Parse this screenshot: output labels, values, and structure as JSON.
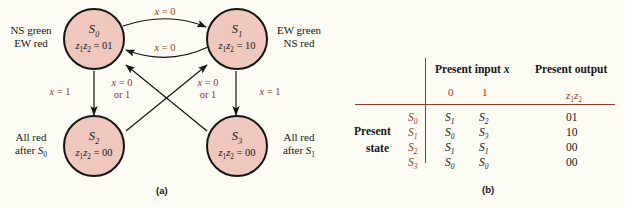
{
  "figure": {
    "panel_a_caption": "(a)",
    "panel_b_caption": "(b)",
    "colors": {
      "node_fill": "#efc7bd",
      "node_stroke": "#141414",
      "label_accent": "#8f3d28",
      "background": "#fdfcf4"
    }
  },
  "diagram": {
    "states": [
      {
        "id": "S0",
        "name": "S",
        "name_sub": "0",
        "output_prefix": "z",
        "output_label": "z₁z₂ = 01",
        "output_value": "01",
        "side_label_line1": "NS green",
        "side_label_line2": "EW red",
        "side_label_position": "left"
      },
      {
        "id": "S1",
        "name": "S",
        "name_sub": "1",
        "output_prefix": "z",
        "output_label": "z₁z₂ = 10",
        "output_value": "10",
        "side_label_line1": "EW green",
        "side_label_line2": "NS red",
        "side_label_position": "right"
      },
      {
        "id": "S2",
        "name": "S",
        "name_sub": "2",
        "output_prefix": "z",
        "output_label": "z₁z₂ = 00",
        "output_value": "00",
        "side_label_line1": "All red",
        "side_label_line2": "after S₀",
        "side_label_position": "left"
      },
      {
        "id": "S3",
        "name": "S",
        "name_sub": "3",
        "output_prefix": "z",
        "output_label": "z₁z₂ = 00",
        "output_value": "00",
        "side_label_line1": "All red",
        "side_label_line2": "after S₁",
        "side_label_position": "right"
      }
    ],
    "transitions": [
      {
        "from": "S0",
        "to": "S1",
        "label_line1": "x = 0",
        "label_line2": ""
      },
      {
        "from": "S1",
        "to": "S0",
        "label_line1": "x = 0",
        "label_line2": ""
      },
      {
        "from": "S0",
        "to": "S2",
        "label_line1": "x = 1",
        "label_line2": ""
      },
      {
        "from": "S1",
        "to": "S3",
        "label_line1": "x = 1",
        "label_line2": ""
      },
      {
        "from": "S2",
        "to": "S1",
        "label_line1": "x = 0",
        "label_line2": "or 1"
      },
      {
        "from": "S3",
        "to": "S0",
        "label_line1": "x = 0",
        "label_line2": "or 1"
      }
    ]
  },
  "table": {
    "header_input": "Present input x",
    "header_output": "Present output",
    "input_columns": [
      "0",
      "1"
    ],
    "output_column": "z₁z₂",
    "row_header_line1": "Present",
    "row_header_line2": "state",
    "rows": [
      {
        "state": "S₀",
        "next_0": "S₁",
        "next_1": "S₂",
        "output": "01"
      },
      {
        "state": "S₁",
        "next_0": "S₀",
        "next_1": "S₃",
        "output": "10"
      },
      {
        "state": "S₂",
        "next_0": "S₁",
        "next_1": "S₁",
        "output": "00"
      },
      {
        "state": "S₃",
        "next_0": "S₀",
        "next_1": "S₀",
        "output": "00"
      }
    ]
  }
}
